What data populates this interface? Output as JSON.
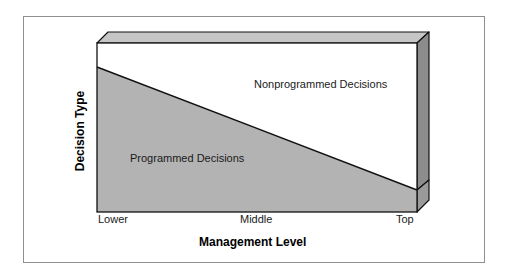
{
  "diagram": {
    "y_axis_label": "Decision Type",
    "x_axis_label": "Management Level",
    "x_ticks": [
      "Lower",
      "Middle",
      "Top"
    ],
    "regions": {
      "upper": "Nonprogrammed Decisions",
      "lower": "Programmed Decisions"
    },
    "colors": {
      "front_gray": "#b3b3b3",
      "top_bevel": "#c6c6c6",
      "side_panel": "#8c8c8c",
      "side_lower": "#9a9a9a",
      "outline": "#111111",
      "frame": "#8f8f8f"
    }
  }
}
